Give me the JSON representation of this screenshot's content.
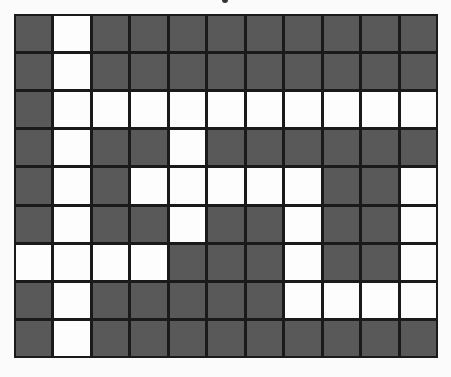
{
  "puzzle": {
    "rows": 9,
    "cols": 11,
    "colors": {
      "filled": "#595959",
      "empty": "#fdfdfd",
      "border": "#1a1a1a"
    },
    "grid": [
      [
        1,
        0,
        1,
        1,
        1,
        1,
        1,
        1,
        1,
        1,
        1
      ],
      [
        1,
        0,
        1,
        1,
        1,
        1,
        1,
        1,
        1,
        1,
        1
      ],
      [
        1,
        0,
        0,
        0,
        0,
        0,
        0,
        0,
        0,
        0,
        0
      ],
      [
        1,
        0,
        1,
        1,
        0,
        1,
        1,
        1,
        1,
        1,
        1
      ],
      [
        1,
        0,
        1,
        0,
        0,
        0,
        0,
        0,
        1,
        1,
        0
      ],
      [
        1,
        0,
        1,
        1,
        0,
        1,
        1,
        0,
        1,
        1,
        0
      ],
      [
        0,
        0,
        0,
        0,
        1,
        1,
        1,
        0,
        1,
        1,
        0
      ],
      [
        1,
        0,
        1,
        1,
        1,
        1,
        1,
        0,
        0,
        0,
        0
      ],
      [
        1,
        0,
        1,
        1,
        1,
        1,
        1,
        1,
        1,
        1,
        1
      ]
    ]
  }
}
